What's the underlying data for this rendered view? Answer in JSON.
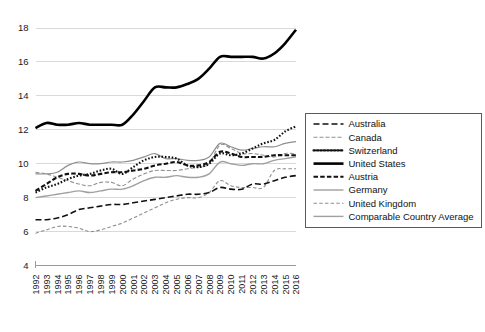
{
  "chart_data": {
    "type": "line",
    "title": "",
    "xlabel": "",
    "ylabel": "",
    "ylim": [
      4,
      18.6
    ],
    "yticks": [
      4,
      6,
      8,
      10,
      12,
      14,
      16,
      18
    ],
    "grid": true,
    "legend_position": "right",
    "x": [
      1992,
      1993,
      1994,
      1995,
      1996,
      1997,
      1998,
      1999,
      2000,
      2001,
      2002,
      2003,
      2004,
      2005,
      2006,
      2007,
      2008,
      2009,
      2010,
      2011,
      2012,
      2013,
      2014,
      2015,
      2016
    ],
    "xtick_labels": [
      "1992",
      "1993",
      "1994",
      "1995",
      "1996",
      "1997",
      "1998",
      "1999",
      "2000",
      "2001",
      "2002",
      "2003",
      "2004",
      "2005",
      "2006",
      "2007",
      "2008",
      "2009",
      "2010",
      "2011",
      "2012",
      "2013",
      "2014",
      "2015",
      "2016"
    ],
    "series": [
      {
        "name": "Australia",
        "style": "dashed",
        "color": "#111111",
        "width": 1.6,
        "dasharray": "6,3",
        "values": [
          6.7,
          6.7,
          6.8,
          7.0,
          7.3,
          7.4,
          7.5,
          7.6,
          7.6,
          7.7,
          7.8,
          7.9,
          8.0,
          8.1,
          8.2,
          8.2,
          8.3,
          8.6,
          8.5,
          8.5,
          8.8,
          8.8,
          9.0,
          9.2,
          9.3
        ]
      },
      {
        "name": "Canada",
        "style": "dash-dot-fine",
        "color": "#8f8f8f",
        "width": 1.1,
        "dasharray": "4,2",
        "values": [
          9.5,
          9.4,
          9.2,
          9.0,
          8.8,
          8.7,
          8.9,
          8.9,
          8.7,
          9.1,
          9.4,
          9.6,
          9.6,
          9.6,
          9.7,
          9.8,
          10.0,
          11.1,
          10.9,
          10.6,
          10.6,
          10.5,
          10.4,
          10.6,
          10.6
        ]
      },
      {
        "name": "Switzerland",
        "style": "dotted",
        "color": "#111111",
        "width": 2.1,
        "dasharray": "1.6,1.8",
        "values": [
          8.3,
          8.6,
          8.8,
          9.1,
          9.3,
          9.4,
          9.6,
          9.7,
          9.4,
          9.8,
          10.2,
          10.4,
          10.4,
          10.3,
          9.9,
          9.8,
          10.0,
          10.6,
          10.5,
          10.6,
          10.9,
          11.2,
          11.4,
          11.9,
          12.2
        ]
      },
      {
        "name": "United States",
        "style": "solid-thick",
        "color": "#000000",
        "width": 2.6,
        "dasharray": "",
        "values": [
          12.1,
          12.4,
          12.3,
          12.3,
          12.4,
          12.3,
          12.3,
          12.3,
          12.3,
          12.9,
          13.7,
          14.5,
          14.5,
          14.5,
          14.7,
          15.0,
          15.6,
          16.3,
          16.3,
          16.3,
          16.3,
          16.2,
          16.5,
          17.1,
          17.9
        ]
      },
      {
        "name": "Austria",
        "style": "dashed-bold",
        "color": "#111111",
        "width": 2.1,
        "dasharray": "4.5,2.2",
        "values": [
          8.4,
          8.8,
          9.2,
          9.4,
          9.4,
          9.3,
          9.4,
          9.5,
          9.5,
          9.6,
          9.7,
          9.9,
          10.0,
          10.1,
          9.9,
          9.9,
          10.1,
          10.7,
          10.6,
          10.4,
          10.4,
          10.4,
          10.5,
          10.5,
          10.5
        ]
      },
      {
        "name": "Germany",
        "style": "solid-thin",
        "color": "#8f8f8f",
        "width": 1.2,
        "dasharray": "",
        "values": [
          9.4,
          9.4,
          9.5,
          9.9,
          10.1,
          10.0,
          10.0,
          10.1,
          10.1,
          10.2,
          10.4,
          10.6,
          10.3,
          10.3,
          10.2,
          10.2,
          10.4,
          11.2,
          11.0,
          10.8,
          10.9,
          11.0,
          11.0,
          11.2,
          11.3
        ]
      },
      {
        "name": "United Kingdom",
        "style": "dash-fine",
        "color": "#8f8f8f",
        "width": 1.1,
        "dasharray": "3.5,2.2",
        "values": [
          5.9,
          6.1,
          6.3,
          6.3,
          6.2,
          6.0,
          6.1,
          6.3,
          6.5,
          6.8,
          7.1,
          7.4,
          7.7,
          7.9,
          8.0,
          8.0,
          8.3,
          9.0,
          8.7,
          8.6,
          8.6,
          8.6,
          9.6,
          9.7,
          9.7
        ]
      },
      {
        "name": "Comparable Country Average",
        "style": "solid-medium",
        "color": "#a0a0a0",
        "width": 1.4,
        "values": [
          8.0,
          8.1,
          8.2,
          8.3,
          8.4,
          8.3,
          8.4,
          8.5,
          8.5,
          8.7,
          9.0,
          9.2,
          9.2,
          9.3,
          9.2,
          9.2,
          9.4,
          10.1,
          10.0,
          9.9,
          10.0,
          10.0,
          10.2,
          10.3,
          10.4
        ]
      }
    ]
  },
  "legend": {
    "items": [
      {
        "label": "Australia"
      },
      {
        "label": "Canada"
      },
      {
        "label": "Switzerland"
      },
      {
        "label": "United States"
      },
      {
        "label": "Austria"
      },
      {
        "label": "Germany"
      },
      {
        "label": "United Kingdom"
      },
      {
        "label": "Comparable Country Average"
      }
    ]
  }
}
